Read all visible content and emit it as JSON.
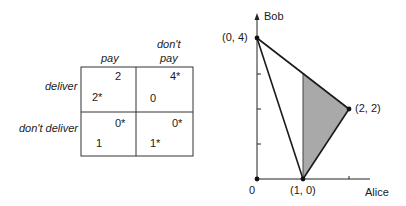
{
  "payoff_matrix": {
    "columns": [
      "pay",
      "don't\npay"
    ],
    "column_labels": {
      "pay": "pay",
      "dont_pay_line1": "don't",
      "dont_pay_line2": "pay"
    },
    "rows": [
      "deliver",
      "don't deliver"
    ],
    "cells": [
      [
        {
          "row_payoff": "2*",
          "col_payoff": "2"
        },
        {
          "row_payoff": "0",
          "col_payoff": "4*"
        }
      ],
      [
        {
          "row_payoff": "1",
          "col_payoff": "0*"
        },
        {
          "row_payoff": "1*",
          "col_payoff": "0*"
        }
      ]
    ]
  },
  "payoff_plot": {
    "x_axis_label": "Alice",
    "y_axis_label": "Bob",
    "origin_label": "0",
    "points": [
      {
        "label": "(0, 4)",
        "x": 0,
        "y": 4
      },
      {
        "label": "(2, 2)",
        "x": 2,
        "y": 2
      },
      {
        "label": "(1, 0)",
        "x": 1,
        "y": 0
      }
    ],
    "shaded_region": [
      [
        1,
        0
      ],
      [
        1,
        3
      ],
      [
        2,
        2
      ]
    ],
    "colors": {
      "shade": "#a9a9a9",
      "line": "#1a1a1a"
    }
  }
}
